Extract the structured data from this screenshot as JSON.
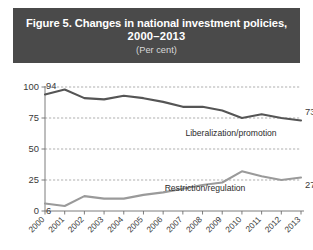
{
  "figure": {
    "title_line1": "Figure 5. Changes in national investment policies,",
    "title_line2": "2000–2013",
    "subtitle": "(Per cent)",
    "banner_color": "#4a4a4a",
    "banner_text_color": "#ffffff"
  },
  "chart_data": {
    "type": "line",
    "title": "Figure 5. Changes in national investment policies, 2000–2013",
    "subtitle": "(Per cent)",
    "xlabel": "",
    "ylabel": "",
    "ylim": [
      0,
      100
    ],
    "yticks": [
      0,
      25,
      50,
      75,
      100
    ],
    "grid": true,
    "legend_position": "inline-labels",
    "categories": [
      "2000",
      "2001",
      "2002",
      "2003",
      "2004",
      "2005",
      "2006",
      "2007",
      "2008",
      "2009",
      "2010",
      "2011",
      "2012",
      "2013"
    ],
    "series": [
      {
        "name": "Liberalization/promotion",
        "color": "#555555",
        "values": [
          94,
          98,
          91,
          90,
          93,
          91,
          88,
          84,
          84,
          81,
          75,
          78,
          75,
          73
        ]
      },
      {
        "name": "Restriction/regulation",
        "color": "#9a9a9a",
        "values": [
          6,
          4,
          12,
          10,
          10,
          13,
          15,
          18,
          21,
          23,
          32,
          28,
          25,
          27
        ]
      }
    ],
    "annotations": [
      {
        "text": "94",
        "series": "Liberalization/promotion",
        "category": "2000",
        "value": 94
      },
      {
        "text": "73",
        "series": "Liberalization/promotion",
        "category": "2013",
        "value": 73
      },
      {
        "text": "6",
        "series": "Restriction/regulation",
        "category": "2000",
        "value": 6
      },
      {
        "text": "27",
        "series": "Restriction/regulation",
        "category": "2013",
        "value": 27
      }
    ],
    "inline_labels": [
      {
        "text": "Liberalization/promotion"
      },
      {
        "text": "Restriction/regulation"
      }
    ]
  }
}
